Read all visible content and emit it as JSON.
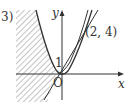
{
  "problem_label": "3)",
  "axes": {
    "x_label": "x",
    "y_label": "y",
    "origin_label": "O"
  },
  "annotations": {
    "point_label": "(2, 4)",
    "y_intercept_label": "1"
  },
  "curves": [
    {
      "name": "parabola",
      "equation": "y = x^2"
    },
    {
      "name": "line",
      "equation": "y = 1.5x + 1",
      "passes_through": [
        "(0, 1)",
        "(2, 4)"
      ]
    }
  ],
  "shaded_region": "left of line, hatched",
  "colors": {
    "stroke": "#333333",
    "hatch": "#888888"
  }
}
